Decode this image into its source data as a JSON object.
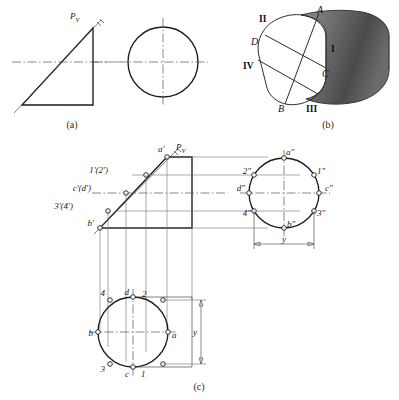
{
  "figures": [
    {
      "id": "a",
      "caption": "(a)",
      "labels": {
        "cutting_plane": "P",
        "cutting_plane_sub": "V"
      }
    },
    {
      "id": "b",
      "caption": "(b)",
      "labels": {
        "pointA": "A",
        "pointB": "B",
        "pointC": "C",
        "pointD": "D",
        "roman1": "I",
        "roman2": "II",
        "roman3": "III",
        "roman4": "IV"
      }
    },
    {
      "id": "c",
      "caption": "(c)",
      "front_view": {
        "cutting_plane": "P",
        "cutting_plane_sub": "V",
        "points": [
          "a'",
          "1'(2')",
          "c'(d')",
          "3'(4')",
          "b'"
        ]
      },
      "side_view": {
        "points": [
          "a\"",
          "1\"",
          "2\"",
          "3\"",
          "4\"",
          "b\"",
          "c\"",
          "d\""
        ],
        "dimension": "y"
      },
      "top_view": {
        "points": [
          "a",
          "b",
          "c",
          "d",
          "1",
          "2",
          "3",
          "4"
        ],
        "dimension": "y"
      }
    }
  ],
  "footer_caption": "(c)"
}
